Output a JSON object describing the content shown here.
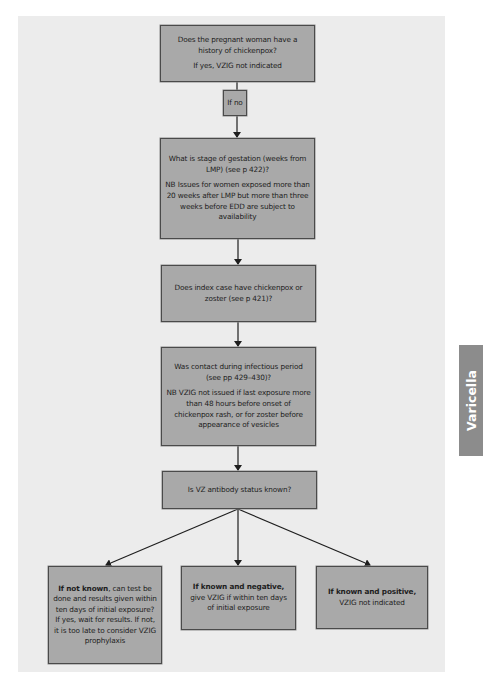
{
  "side_tab": {
    "label": "Varicella"
  },
  "flowchart": {
    "nodes": [
      {
        "id": "history",
        "lines": [
          "Does the pregnant woman have a history of chickenpox?",
          "If yes, VZIG not indicated"
        ]
      },
      {
        "id": "if_no",
        "lines": [
          "If no"
        ]
      },
      {
        "id": "gestation",
        "lines": [
          "What is stage of gestation (weeks from LMP) (see p 422)?",
          "NB Issues for women exposed more than 20 weeks after LMP but more than three weeks before EDD are subject to availability"
        ]
      },
      {
        "id": "index_case",
        "lines": [
          "Does index case have chickenpox or zoster (see p 421)?"
        ]
      },
      {
        "id": "infectious_period",
        "lines": [
          "Was contact during infectious period (see pp 429–430)?",
          "NB VZIG not issued if last exposure more than 48 hours before onset of chickenpox rash, or for zoster before appearance of vesicles"
        ]
      },
      {
        "id": "antibody_status",
        "lines": [
          "Is VZ antibody status known?"
        ]
      },
      {
        "id": "not_known",
        "bold": "If not known",
        "rest": ", can test be done and results given within ten days of initial exposure? If yes, wait for results. If not, it is too late to consider VZIG prophylaxis"
      },
      {
        "id": "known_negative",
        "bold": "If known and negative,",
        "rest": " give VZIG if within ten days of initial exposure"
      },
      {
        "id": "known_positive",
        "bold": "If known and positive,",
        "rest": " VZIG not indicated"
      }
    ],
    "edges": [
      {
        "from": "history",
        "to": "if_no"
      },
      {
        "from": "if_no",
        "to": "gestation"
      },
      {
        "from": "gestation",
        "to": "index_case"
      },
      {
        "from": "index_case",
        "to": "infectious_period"
      },
      {
        "from": "infectious_period",
        "to": "antibody_status"
      },
      {
        "from": "antibody_status",
        "to": "not_known"
      },
      {
        "from": "antibody_status",
        "to": "known_negative"
      },
      {
        "from": "antibody_status",
        "to": "known_positive"
      }
    ]
  }
}
